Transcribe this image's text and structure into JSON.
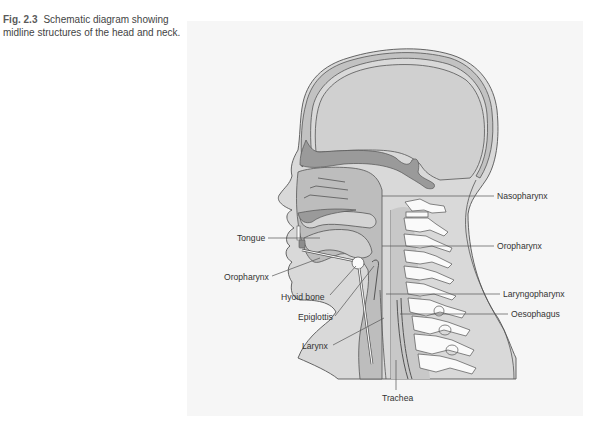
{
  "caption": {
    "figure_number": "Fig. 2.3",
    "text": "Schematic diagram showing midline structures of the head and neck."
  },
  "figure": {
    "labels": {
      "nasopharynx": "Nasopharynx",
      "oropharynx_right": "Oropharynx",
      "laryngopharynx": "Laryngopharynx",
      "oesophagus": "Oesophagus",
      "tongue": "Tongue",
      "oropharynx_left": "Oropharynx",
      "hyoid_bone": "Hyoid bone",
      "epiglottis": "Epiglottis",
      "larynx": "Larynx",
      "trachea": "Trachea"
    },
    "colors": {
      "panel_bg": "#f6f6f6",
      "skin": "#d9d9d9",
      "tissue": "#c8c8c8",
      "cavity": "#b3b3b3",
      "dark": "#8f8f8f",
      "bone": "#fafafa",
      "outline": "#555555"
    }
  }
}
